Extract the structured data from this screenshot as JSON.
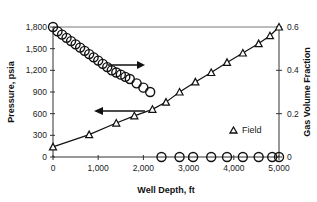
{
  "chart_data": {
    "type": "line",
    "title": "",
    "xlabel": "Well Depth, ft",
    "ylabel": "Pressure, psia",
    "y2label": "Gas Volume Fraction",
    "xlim": [
      0,
      5000
    ],
    "ylim": [
      0,
      1800
    ],
    "y2lim": [
      0,
      0.6
    ],
    "x_ticks": [
      "0",
      "1,000",
      "2,000",
      "3,000",
      "4,000",
      "5,000"
    ],
    "y_ticks": [
      "0",
      "300",
      "600",
      "900",
      "1,200",
      "1,500",
      "1,800"
    ],
    "y2_ticks": [
      "0",
      "0.2",
      "0.4",
      "0.6"
    ],
    "grid": false,
    "legend": {
      "position": "lower-right-inside",
      "entries": [
        "Field"
      ]
    },
    "series": [
      {
        "name": "Field",
        "marker": "triangle",
        "axis": "left",
        "x": [
          0,
          800,
          1400,
          1800,
          2200,
          2500,
          2800,
          3150,
          3500,
          3850,
          4200,
          4550,
          4800,
          5000
        ],
        "values": [
          140,
          310,
          470,
          570,
          660,
          760,
          900,
          1040,
          1170,
          1310,
          1440,
          1570,
          1680,
          1800
        ]
      },
      {
        "name": "Model pressure",
        "marker": "none",
        "axis": "left",
        "x": [
          0,
          800,
          1400,
          1800,
          2200,
          2500,
          2800,
          3150,
          3500,
          3850,
          4200,
          4550,
          4800,
          5000
        ],
        "values": [
          140,
          310,
          470,
          570,
          660,
          760,
          900,
          1040,
          1170,
          1310,
          1440,
          1570,
          1680,
          1800
        ]
      },
      {
        "name": "Gas Volume Fraction",
        "marker": "circle",
        "axis": "right",
        "x": [
          0,
          100,
          200,
          300,
          400,
          500,
          600,
          700,
          800,
          900,
          1000,
          1100,
          1200,
          1300,
          1400,
          1500,
          1600,
          1700,
          1850,
          2000,
          2150,
          2400,
          2800,
          3100,
          3500,
          3850,
          4200,
          4550,
          4850,
          5000
        ],
        "values": [
          0.6,
          0.58,
          0.565,
          0.55,
          0.535,
          0.52,
          0.505,
          0.49,
          0.475,
          0.46,
          0.445,
          0.43,
          0.415,
          0.4,
          0.39,
          0.38,
          0.37,
          0.36,
          0.34,
          0.32,
          0.3,
          0,
          0,
          0,
          0,
          0,
          0,
          0,
          0,
          0
        ]
      }
    ],
    "annotations": [
      {
        "type": "arrow",
        "direction": "right",
        "meaning": "circles refer to right axis (Gas Volume Fraction)"
      },
      {
        "type": "arrow",
        "direction": "left",
        "meaning": "triangles/line refer to left axis (Pressure)"
      }
    ]
  }
}
